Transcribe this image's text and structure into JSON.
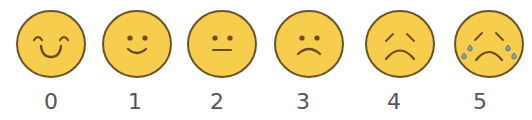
{
  "scale": {
    "name": "pain-rating-scale",
    "colors": {
      "face_fill": "#F6CD4C",
      "face_outline": "#6A5427",
      "feature": "#6B4A1E",
      "tear_fill": "#8FA3B3",
      "tear_outline": "#5E6F7C",
      "label": "#555555"
    },
    "items": [
      {
        "value": "0",
        "expression": "very-happy",
        "face_x": 15,
        "label_x": 31
      },
      {
        "value": "1",
        "expression": "happy",
        "face_x": 101,
        "label_x": 115
      },
      {
        "value": "2",
        "expression": "neutral",
        "face_x": 186,
        "label_x": 197
      },
      {
        "value": "3",
        "expression": "slightly-sad",
        "face_x": 273,
        "label_x": 283
      },
      {
        "value": "4",
        "expression": "sad",
        "face_x": 364,
        "label_x": 374
      },
      {
        "value": "5",
        "expression": "crying",
        "face_x": 453,
        "label_x": 460
      }
    ]
  }
}
